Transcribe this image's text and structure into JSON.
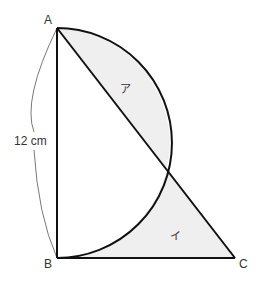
{
  "figure": {
    "points": {
      "A": {
        "label": "A",
        "x": 57,
        "y": 28
      },
      "B": {
        "label": "B",
        "x": 57,
        "y": 258
      },
      "C": {
        "label": "C",
        "x": 235,
        "y": 258
      }
    },
    "length_label": "12 cm",
    "region_labels": {
      "upper": "ア",
      "lower": "イ"
    },
    "colors": {
      "stroke": "#111111",
      "shade": "#efefef",
      "text": "#333333",
      "dimension_line": "#555555"
    }
  }
}
